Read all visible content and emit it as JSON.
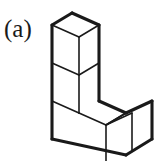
{
  "figure": {
    "label": "(a)",
    "kind": "isometric-polycube-diagram",
    "cube_count": 5,
    "line_color": "#1a1a1a",
    "face_color": "#ffffff",
    "background_color": "#ffffff"
  },
  "geometry": {
    "origin_x": 72,
    "origin_y": 13,
    "half_width": 20,
    "half_depth": 27,
    "rise_left": 12,
    "rise_right": 12,
    "cube_height": 38,
    "cells": [
      {
        "name": "column-cube-top",
        "col": 0,
        "row": 0,
        "level": 2
      },
      {
        "name": "column-cube-middle",
        "col": 0,
        "row": 0,
        "level": 1
      },
      {
        "name": "column-cube-bottom",
        "col": 0,
        "row": 0,
        "level": 0
      },
      {
        "name": "row-cube-middle",
        "col": 1,
        "row": 0,
        "level": 0
      },
      {
        "name": "row-cube-right",
        "col": 2,
        "row": 0,
        "level": 0
      }
    ]
  },
  "outline": {
    "name": "silhouette-path",
    "points": "72,13 99,25 99,101 126,113 152,101 152,139 126,155 99,143 99,143 52,120 52,25"
  }
}
